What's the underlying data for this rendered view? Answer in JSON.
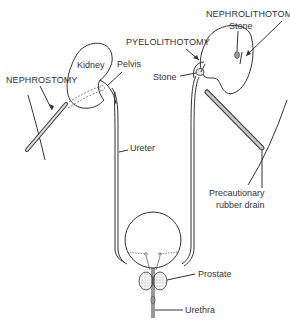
{
  "diagram": {
    "type": "urinary-tract-surgical-procedures",
    "labels": {
      "nephrostomy": "NEPHROSTOMY",
      "kidney": "Kidney",
      "pelvis": "Pelvis",
      "ureter": "Ureter",
      "pyelolithotomy": "PYELOLITHOTOMY",
      "nephrolithotomy": "NEPHROLITHOTOMY",
      "stone_pelvis": "Stone",
      "stone_kidney": "Stone",
      "drain_line1": "Precautionary",
      "drain_line2": "rubber drain",
      "prostate": "Prostate",
      "urethra": "Urethra"
    },
    "colors": {
      "line": "#333333",
      "background": "#ffffff",
      "stipple": "#bbbbbb",
      "tube_fill": "#d0d0d0"
    }
  }
}
